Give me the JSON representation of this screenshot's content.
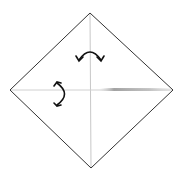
{
  "diagram": {
    "type": "origami-step",
    "colors": {
      "background": "#ffffff",
      "outline": "#333333",
      "crease": "#c8c8c8",
      "shadow": "#9a9a9a",
      "arrow": "#111111"
    },
    "paper": {
      "vertices": {
        "top": [
          90,
          13
        ],
        "right": [
          173,
          90
        ],
        "bottom": [
          91,
          168
        ],
        "left": [
          10,
          90
        ]
      }
    },
    "creases": [
      {
        "name": "vertical-crease",
        "from": [
          90,
          13
        ],
        "to": [
          91,
          168
        ]
      },
      {
        "name": "horizontal-crease",
        "from": [
          10,
          90
        ],
        "to": [
          173,
          90
        ]
      }
    ],
    "arrows": [
      {
        "name": "fold-unfold-arrow-horizontal",
        "meaning": "fold left to right and unfold",
        "center": [
          90,
          57
        ]
      },
      {
        "name": "fold-unfold-arrow-vertical",
        "meaning": "fold top to bottom and unfold",
        "center": [
          60,
          92
        ]
      }
    ]
  }
}
